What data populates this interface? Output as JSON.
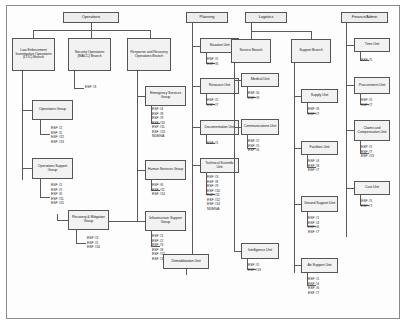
{
  "chart_title": "Incident Command System Organization with ESF Assignments",
  "sections": {
    "operations": {
      "title": "Operations",
      "branches": [
        {
          "label": "Law Enforcement Investigative Operations (LOC) Branch"
        },
        {
          "label": "Security Operations (MACC) Branch",
          "esf": "ESF #3"
        },
        {
          "label": "Response and Recovery Operations Branch"
        }
      ],
      "groups": [
        {
          "label": "Operations Group",
          "esf": "ESF #2\nESF #5\nESF #12\nESF #13"
        },
        {
          "label": "Operations Support Group",
          "esf": "ESF #1\nESF #5\nESF #6\nESF #11\nESF #15"
        },
        {
          "label": "Recovery & Mitigation Group",
          "esf": "ESF #3\nESF #5\nESF #14"
        },
        {
          "label": "Emergency Services Group",
          "esf": "ESF #4\nESF #8\nESF #9\nESF #10\nESF #11\nESF #13\nNDMSA"
        },
        {
          "label": "Human Services Group",
          "esf": "ESF #6\nESF #11\nESF #14"
        },
        {
          "label": "Infrastructure Support Group",
          "esf": "ESF #1\nESF #2\nESF #3\nESF #8\nESF #12\nESF #14"
        }
      ]
    },
    "planning": {
      "title": "Planning",
      "units": [
        {
          "label": "Situation Unit",
          "esf": "ESF #5\nESF #6"
        },
        {
          "label": "Resource Unit",
          "esf": "ESF #5\nESF #7"
        },
        {
          "label": "Documentation Unit",
          "esf": "ESF #5"
        },
        {
          "label": "Technical Scientific Unit",
          "esf": "ESF #3\nESF #8\nESF #9\nESF #10\nESF #11\nESF #12\nESF #14\nNDMSA"
        },
        {
          "label": "Demobilization Unit",
          "esf": ""
        }
      ]
    },
    "logistics": {
      "title": "Logistics",
      "branches": [
        {
          "label": "Service Branch"
        },
        {
          "label": "Support Branch"
        }
      ],
      "service_units": [
        {
          "label": "Medical Unit",
          "esf": "ESF #6\nESF #8"
        },
        {
          "label": "Communications Unit",
          "esf": "ESF #2\nESF #5\nESF #6"
        },
        {
          "label": "Intelligence Unit",
          "esf": "ESF #5\nESF #13"
        }
      ],
      "support_units": [
        {
          "label": "Supply Unit",
          "esf": "ESF #6\nESF #7"
        },
        {
          "label": "Facilities Unit",
          "esf": "ESF #4\nESF #6\nESF #7"
        },
        {
          "label": "Ground Support Unit",
          "esf": "ESF #1\nESF #4\nESF #6\nESF #7"
        },
        {
          "label": "Air Support Unit",
          "esf": "ESF #1\nESF #4\nESF #6\nESF #7"
        }
      ]
    },
    "finance": {
      "title": "Finance/Admin",
      "units": [
        {
          "label": "Time Unit",
          "esf": "ESF #5"
        },
        {
          "label": "Procurement Unit",
          "esf": "ESF #5\nESF #7"
        },
        {
          "label": "Claims and Compensation Unit",
          "esf": "ESF #5\nESF #7\nESF #13"
        },
        {
          "label": "Cost Unit",
          "esf": "ESF #5\nESF #7"
        }
      ]
    }
  }
}
